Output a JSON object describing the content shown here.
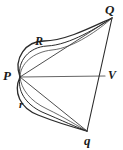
{
  "figure": {
    "type": "geometric-diagram",
    "width": 123,
    "height": 150,
    "background_color": "#ffffff",
    "stroke_color": "#2b2b2b",
    "chord_color": "#555555",
    "labels": {
      "Q": "Q",
      "R": "R",
      "P": "P",
      "V": "V",
      "r": "r",
      "q": "q"
    },
    "points": {
      "P": {
        "x": 20,
        "y": 77
      },
      "Q": {
        "x": 112,
        "y": 18
      },
      "q": {
        "x": 87,
        "y": 131
      },
      "V": {
        "x": 105,
        "y": 76
      },
      "R": {
        "x": 44,
        "y": 48
      },
      "r": {
        "x": 28,
        "y": 105
      }
    },
    "edges": [
      {
        "name": "P-V",
        "from": "P",
        "to": "V",
        "kind": "straight"
      },
      {
        "name": "Q-q",
        "from": "Q",
        "to": "q",
        "kind": "straight"
      },
      {
        "name": "P-Q-chord",
        "from": "P",
        "to": "Q",
        "kind": "straight"
      },
      {
        "name": "P-q-chord",
        "from": "P",
        "to": "q",
        "kind": "straight"
      },
      {
        "name": "P-Q-arc-outer",
        "from": "P",
        "to": "Q",
        "kind": "arc"
      },
      {
        "name": "P-Q-arc-inner",
        "from": "P",
        "to": "Q",
        "kind": "arc"
      },
      {
        "name": "P-q-arc-outer",
        "from": "P",
        "to": "q",
        "kind": "arc"
      },
      {
        "name": "P-q-arc-inner",
        "from": "P",
        "to": "q",
        "kind": "arc"
      }
    ]
  }
}
